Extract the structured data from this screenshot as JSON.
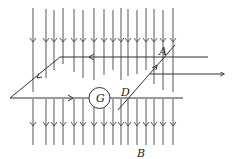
{
  "figure": {
    "type": "physics-diagram",
    "labels": {
      "A": "A",
      "D": "D",
      "G": "G",
      "B": "B"
    },
    "field": {
      "direction": "down",
      "line_x": [
        33,
        46,
        54,
        63,
        74,
        83,
        94,
        104,
        113,
        121,
        128,
        137,
        146,
        154,
        163,
        173
      ],
      "arrow_rows_y": [
        42,
        126
      ]
    },
    "colors": {
      "line": "#333333",
      "background": "#ffffff"
    }
  }
}
